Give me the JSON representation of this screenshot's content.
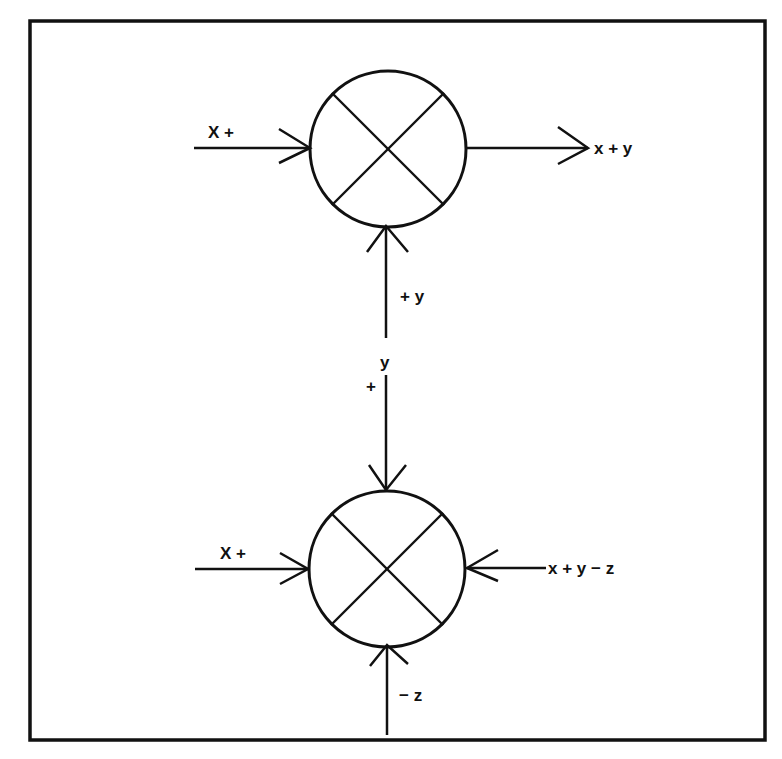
{
  "diagram": {
    "type": "summing-junction block diagram",
    "colors": {
      "line": "#111111",
      "background": "#ffffff"
    },
    "top_junction": {
      "icon": "summing-junction-icon",
      "inputs": [
        {
          "name": "x",
          "label": "X +",
          "direction": "from-left"
        },
        {
          "name": "y",
          "label": "+ y",
          "direction": "from-bottom"
        }
      ],
      "output": {
        "label": "x + y",
        "direction": "to-right"
      }
    },
    "connector": {
      "signal_label": "y",
      "sign_label": "+"
    },
    "bottom_junction": {
      "icon": "summing-junction-icon",
      "inputs": [
        {
          "name": "x",
          "label": "X +",
          "direction": "from-left"
        },
        {
          "name": "y",
          "label": "+",
          "direction": "from-top"
        },
        {
          "name": "z",
          "label": "− z",
          "direction": "from-bottom"
        }
      ],
      "output": {
        "label": "x + y − z",
        "direction": "to-right (arrow points into junction)"
      }
    }
  }
}
